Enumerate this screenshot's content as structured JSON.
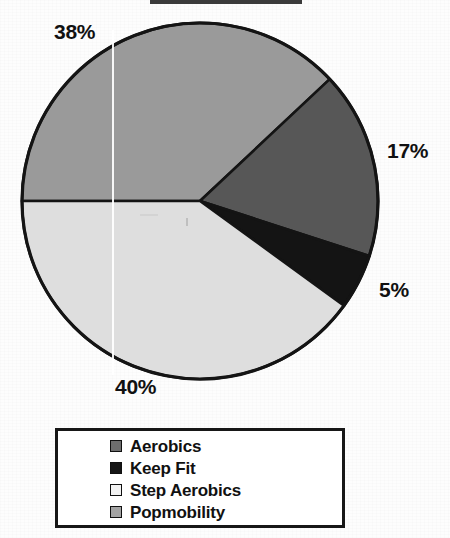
{
  "chart_data": {
    "type": "pie",
    "title": "",
    "categories": [
      "Aerobics",
      "Keep Fit",
      "Step Aerobics",
      "Popmobility"
    ],
    "values": [
      17,
      5,
      40,
      38
    ],
    "value_labels": [
      "17%",
      "5%",
      "40%",
      "38%"
    ],
    "units": "percent",
    "total": 100,
    "legend_position": "bottom",
    "grid": false,
    "colors": {
      "Aerobics": "#575757",
      "Keep Fit": "#141414",
      "Step Aerobics": "#dedede",
      "Popmobility": "#9a9a9a"
    },
    "slice_order_clockwise_from_west": [
      "Popmobility",
      "Aerobics",
      "Keep Fit",
      "Step Aerobics"
    ],
    "outline_color": "#141414"
  },
  "pie": {
    "center_x": 200,
    "center_y": 201,
    "radius": 178,
    "start_angle_deg": 180,
    "labels": [
      {
        "id": "popmobility",
        "text": "38%"
      },
      {
        "id": "aerobics",
        "text": "17%"
      },
      {
        "id": "keepfit",
        "text": "5%"
      },
      {
        "id": "step",
        "text": "40%"
      }
    ]
  },
  "legend": {
    "items": [
      {
        "label": "Aerobics",
        "swatch": "#6e6e6e"
      },
      {
        "label": "Keep Fit",
        "swatch": "#161616"
      },
      {
        "label": "Step Aerobics",
        "swatch": "#f2f2f2"
      },
      {
        "label": "Popmobility",
        "swatch": "#a3a3a3"
      }
    ]
  }
}
